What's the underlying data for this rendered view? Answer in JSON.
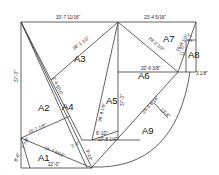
{
  "diagram": {
    "areas": [
      {
        "id": "A1",
        "label": "A1",
        "x": 38,
        "y": 158
      },
      {
        "id": "A2",
        "label": "A2",
        "x": 38,
        "y": 108
      },
      {
        "id": "A3",
        "label": "A3",
        "x": 74,
        "y": 60
      },
      {
        "id": "A4",
        "label": "A4",
        "x": 62,
        "y": 109
      },
      {
        "id": "A5",
        "label": "A5",
        "x": 107,
        "y": 102
      },
      {
        "id": "A6",
        "label": "A6",
        "x": 140,
        "y": 76
      },
      {
        "id": "A7",
        "label": "A7",
        "x": 165,
        "y": 40
      },
      {
        "id": "A8",
        "label": "A8",
        "x": 190,
        "y": 57
      },
      {
        "id": "A9",
        "label": "A9",
        "x": 144,
        "y": 132
      }
    ],
    "dimensions": {
      "top_left": "33'-7 11/16\"",
      "top_right": "23'-4 5/16\"",
      "left_side": "37'-3\"",
      "a3_diag": "26'-1 1/2\"",
      "a2_diag": "15'-7 7/8\"",
      "a1_diag": "24'-7 5/16\"",
      "a1_bottom": "22'-0\"",
      "a1_left": "8'-6\"",
      "a1_short": "7 7/8\"",
      "a5_diag": "36'-9 1/8\"",
      "a5_right": "37'-3\"",
      "a6_horiz": "20'-6 3/8\"",
      "a7_diag": "29'-2 1/2\"",
      "a7_inner": "16'-3 1/2\"",
      "a8_vert": "11'-8\"",
      "a8_small": "3 1/8\"",
      "a8_side": "3'-7\"",
      "a9_chord": "25'-3 9/16\"",
      "a9_sag": "13'-8\"",
      "a4_upper": "2'-8 5/16\"",
      "a4_lower": "3'-10\"",
      "center_a": "8'-10\"",
      "center_b": "10'-8 1/4\"",
      "center_c": "3'-4\""
    }
  }
}
